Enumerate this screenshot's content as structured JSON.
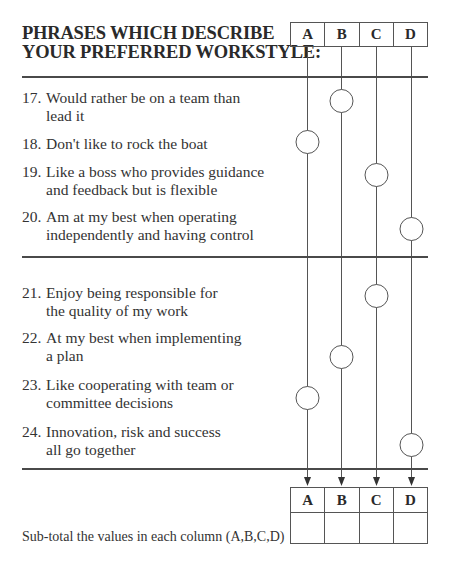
{
  "title": {
    "line1": "PHRASES WHICH DESCRIBE",
    "line2": "YOUR PREFERRED WORKSTYLE:"
  },
  "columns": [
    "A",
    "B",
    "C",
    "D"
  ],
  "groups": [
    {
      "items": [
        {
          "number": "17.",
          "line1": "Would rather be on a team than",
          "line2": "lead it",
          "selected": "B"
        },
        {
          "number": "18.",
          "line1": "Don't like to rock the boat",
          "line2": "",
          "selected": "A"
        },
        {
          "number": "19.",
          "line1": "Like a boss who provides guidance",
          "line2": "and feedback but is flexible",
          "selected": "C"
        },
        {
          "number": "20.",
          "line1": "Am at my best when operating",
          "line2": "independently and having control",
          "selected": "D"
        }
      ]
    },
    {
      "items": [
        {
          "number": "21.",
          "line1": "Enjoy being responsible for",
          "line2": "the quality of my work",
          "selected": "C"
        },
        {
          "number": "22.",
          "line1": "At my best when implementing",
          "line2": "a plan",
          "selected": "B"
        },
        {
          "number": "23.",
          "line1": "Like cooperating with team or",
          "line2": "committee decisions",
          "selected": "A"
        },
        {
          "number": "24.",
          "line1": "Innovation, risk and success",
          "line2": "all go together",
          "selected": "D"
        }
      ]
    }
  ],
  "subtotal": {
    "label": "Sub-total the values in each column (A,B,C,D)",
    "columns": [
      "A",
      "B",
      "C",
      "D"
    ],
    "values": [
      "",
      "",
      "",
      ""
    ]
  },
  "colors": {
    "text": "#333333",
    "rule": "#4a4a4a",
    "line": "#555555"
  }
}
